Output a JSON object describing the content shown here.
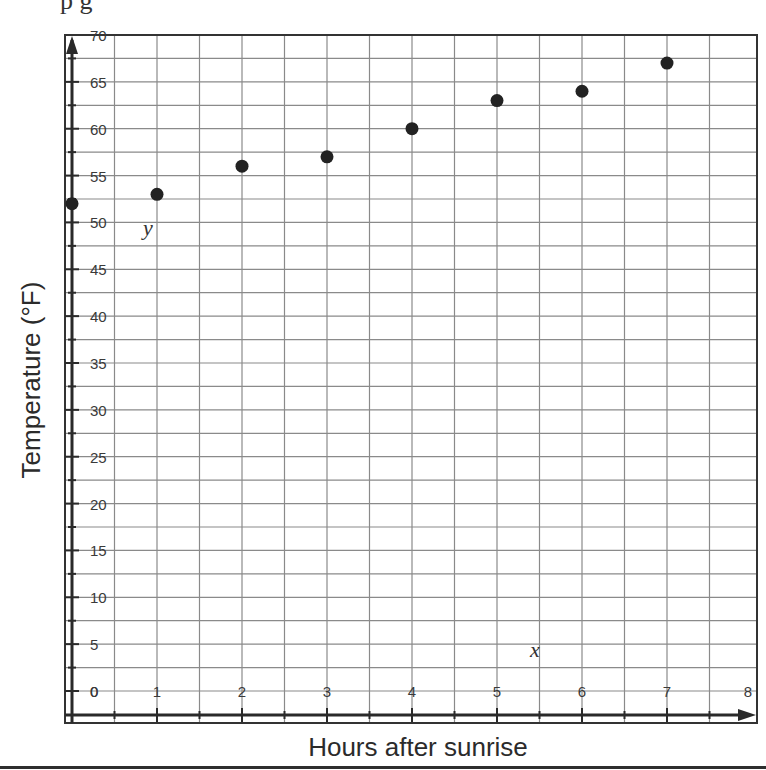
{
  "page": {
    "cropped_top_text": "p                g"
  },
  "chart_data": {
    "type": "scatter",
    "title": "",
    "xlabel": "Hours after sunrise",
    "ylabel": "Temperature (°F)",
    "x_var_label": "x",
    "y_var_label": "y",
    "xlim": [
      0,
      8
    ],
    "ylim": [
      0,
      70
    ],
    "x_ticks": [
      "0",
      "1",
      "2",
      "3",
      "4",
      "5",
      "6",
      "7",
      "8"
    ],
    "y_ticks": [
      "0",
      "5",
      "10",
      "15",
      "20",
      "25",
      "30",
      "35",
      "40",
      "45",
      "50",
      "55",
      "60",
      "65",
      "70"
    ],
    "grid": true,
    "grid_x_step": 0.5,
    "grid_y_step": 2.5,
    "legend": null,
    "series": [
      {
        "name": "Temperature",
        "color": "#222222",
        "points": [
          {
            "x": 0,
            "y": 52
          },
          {
            "x": 1,
            "y": 53
          },
          {
            "x": 2,
            "y": 56
          },
          {
            "x": 3,
            "y": 57
          },
          {
            "x": 4,
            "y": 60
          },
          {
            "x": 5,
            "y": 63
          },
          {
            "x": 6,
            "y": 64
          },
          {
            "x": 7,
            "y": 67
          }
        ]
      }
    ]
  },
  "colors": {
    "grid": "#8a8a8a",
    "axis": "#2a2a2a",
    "frame": "#333333",
    "point": "#222222"
  }
}
